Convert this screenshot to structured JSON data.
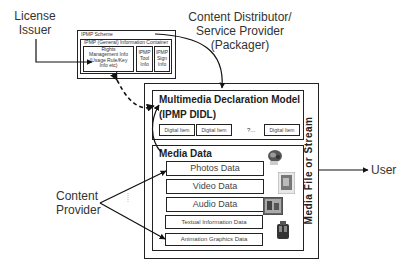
{
  "actors": {
    "license_issuer": [
      "License",
      "Issuer"
    ],
    "content_distributor": [
      "Content Distributor/",
      "Service Provider",
      "(Packager)"
    ],
    "content_provider": [
      "Content",
      "Provider"
    ],
    "user": "User"
  },
  "ipmp_scheme": {
    "title": "IPMP Scheme",
    "container_title": "IPMP (General) Information Container",
    "rights_info": [
      "Rights",
      "Management Info",
      "(Usage Rule/Key",
      "Info etc)"
    ],
    "tool_info": [
      "IPMP",
      "Tool",
      "Info"
    ],
    "sign_info": [
      "IPMP",
      "Sign",
      "Info"
    ]
  },
  "media_file": {
    "label": "Media File or Stream",
    "mdm": {
      "title_line1": "Multimedia Declaration Model",
      "title_line2": "(IPMP DIDL)",
      "items": [
        "Digital Item",
        "Digital Item",
        "?...",
        "Digital Item"
      ]
    },
    "media_data": {
      "title": "Media Data",
      "rows": [
        "Photos Data",
        "Video Data",
        "Audio Data",
        "Textual Information Data",
        "Animation Graphics Data"
      ]
    }
  }
}
